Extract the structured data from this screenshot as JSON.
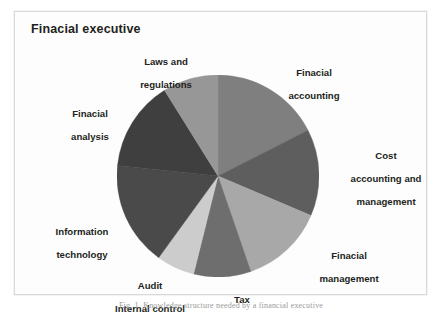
{
  "figure": {
    "title": "Finacial executive",
    "caption": "Fig. 1. Knowledge structure needed by a financial executive",
    "background_color": "#ffffff",
    "frame_border_color": "#d9d9d9"
  },
  "chart_data": {
    "type": "pie",
    "title": "Finacial executive",
    "xlabel": "",
    "ylabel": "",
    "legend_position": "outside-labels",
    "grid": false,
    "start_angle_deg": 0,
    "direction": "clockwise",
    "categories": [
      "Finacial accounting",
      "Cost accounting and management",
      "Finacial management",
      "Tax",
      "Audit\nInternal control",
      "Information technology",
      "Finacial analysis",
      "Laws and regulations"
    ],
    "values": [
      17.5,
      14.0,
      13.3,
      9.2,
      6.1,
      16.7,
      14.4,
      8.8
    ],
    "angles_deg": [
      63,
      50,
      48,
      33,
      22,
      60,
      52,
      32
    ],
    "colors": [
      "#7f7f7f",
      "#5e5e5e",
      "#a8a8a8",
      "#6e6e6e",
      "#cccccc",
      "#4a4a4a",
      "#3f3f3f",
      "#979797"
    ],
    "slices": [
      {
        "label": "Finacial accounting",
        "value": 17.5,
        "angle_deg": 63,
        "color": "#7f7f7f"
      },
      {
        "label": "Cost accounting and management",
        "value": 14.0,
        "angle_deg": 50,
        "color": "#5e5e5e"
      },
      {
        "label": "Finacial management",
        "value": 13.3,
        "angle_deg": 48,
        "color": "#a8a8a8"
      },
      {
        "label": "Tax",
        "value": 9.2,
        "angle_deg": 33,
        "color": "#6e6e6e"
      },
      {
        "label": "Audit Internal control",
        "value": 6.1,
        "angle_deg": 22,
        "color": "#cccccc"
      },
      {
        "label": "Information technology",
        "value": 16.7,
        "angle_deg": 60,
        "color": "#4a4a4a"
      },
      {
        "label": "Finacial analysis",
        "value": 14.4,
        "angle_deg": 52,
        "color": "#3f3f3f"
      },
      {
        "label": "Laws and regulations",
        "value": 8.8,
        "angle_deg": 32,
        "color": "#979797"
      }
    ]
  },
  "labels": {
    "laws_line1": "Laws and",
    "laws_line2": "regulations",
    "finacial_accounting_line1": "Finacial",
    "finacial_accounting_line2": "accounting",
    "cost_line1": "Cost",
    "cost_line2": "accounting and",
    "cost_line3": "management",
    "finacial_management_line1": "Finacial",
    "finacial_management_line2": "management",
    "tax": "Tax",
    "audit_line1": "Audit",
    "audit_line2": "Internal control",
    "it_line1": "Information",
    "it_line2": "technology",
    "finacial_analysis_line1": "Finacial",
    "finacial_analysis_line2": "analysis"
  }
}
